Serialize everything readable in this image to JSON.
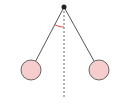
{
  "diagram": {
    "type": "pendulum",
    "colors": {
      "background": "#ffffff",
      "string": "#555555",
      "pivot": "#222222",
      "bob_fill": "#f6cccc",
      "bob_stroke": "#666666",
      "vertical_line": "#666666",
      "angle_arc": "#e05a5a"
    },
    "pivot": {
      "x": 64,
      "y": 7,
      "r": 2.5
    },
    "bobs": [
      {
        "name": "left-bob",
        "x": 31,
        "y": 70,
        "r": 10
      },
      {
        "name": "right-bob",
        "x": 99,
        "y": 70,
        "r": 10
      }
    ],
    "vertical_line": {
      "x": 64,
      "y1": 7,
      "y2": 97
    },
    "angle_arc": {
      "cx": 64,
      "cy": 7,
      "r": 20
    }
  }
}
